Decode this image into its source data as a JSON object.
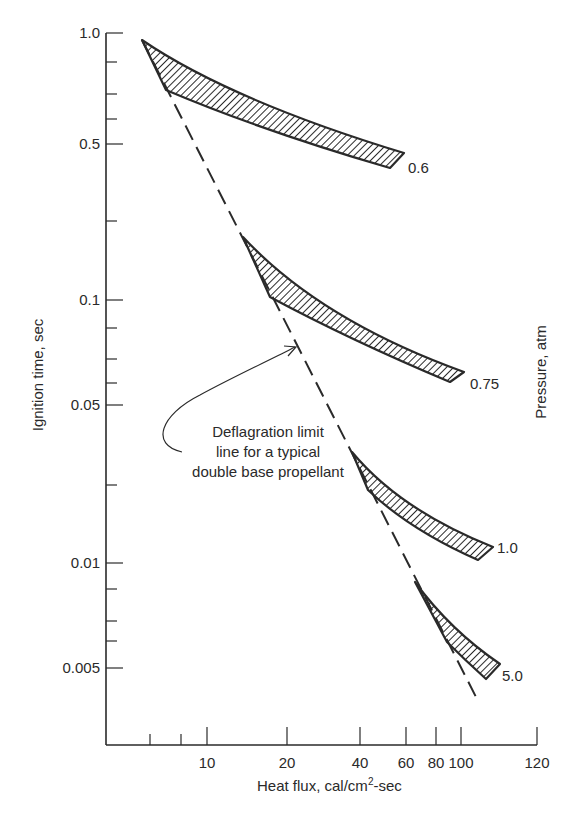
{
  "chart_data": {
    "type": "line",
    "title": "",
    "xlabel": "Heat flux, cal/cm²-sec",
    "xlabel_main": "Heat flux, cal/cm",
    "xlabel_sup": "2",
    "xlabel_tail": "-sec",
    "ylabel": "Ignition time, sec",
    "y2label": "Pressure, atm",
    "xscale": "log",
    "yscale": "log",
    "xlim": [
      5,
      120
    ],
    "ylim": [
      0.003,
      1.0
    ],
    "grid": false,
    "x_ticks": [
      {
        "label": "10",
        "px": 207
      },
      {
        "label": "20",
        "px": 287
      },
      {
        "label": "40",
        "px": 360
      },
      {
        "label": "60",
        "px": 406
      },
      {
        "label": "80",
        "px": 436
      },
      {
        "label": "100",
        "px": 461
      },
      {
        "label": "120",
        "px": 537
      }
    ],
    "x_minor_ticks_px": [
      150,
      181
    ],
    "y_ticks": [
      {
        "label": "1.0",
        "px": 33
      },
      {
        "label": "0.5",
        "px": 144
      },
      {
        "label": "0.1",
        "px": 300
      },
      {
        "label": "0.05",
        "px": 405
      },
      {
        "label": "0.01",
        "px": 563
      },
      {
        "label": "0.005",
        "px": 668
      }
    ],
    "y_minor_ticks_px": [
      62,
      94,
      119,
      221,
      328,
      359,
      383,
      485,
      589,
      621,
      641
    ],
    "series": [
      {
        "name": "0.6",
        "kind": "hatched band",
        "pressure_atm": 0.6,
        "x": [
          5.5,
          10,
          20,
          40,
          60
        ],
        "y_upper": [
          0.95,
          0.75,
          0.6,
          0.5,
          0.45
        ],
        "y_lower": [
          0.75,
          0.65,
          0.53,
          0.45,
          0.42
        ],
        "label_pos": [
          408,
          168
        ]
      },
      {
        "name": "0.75",
        "kind": "hatched band",
        "pressure_atm": 0.75,
        "x": [
          14,
          20,
          40,
          60,
          100
        ],
        "y_upper": [
          0.2,
          0.15,
          0.1,
          0.075,
          0.06
        ],
        "y_lower": [
          0.15,
          0.1,
          0.075,
          0.065,
          0.055
        ],
        "label_pos": [
          470,
          384
        ]
      },
      {
        "name": "1.0",
        "kind": "hatched band",
        "pressure_atm": 1.0,
        "x": [
          38,
          45,
          60,
          80,
          110
        ],
        "y_upper": [
          0.035,
          0.027,
          0.02,
          0.015,
          0.011
        ],
        "y_lower": [
          0.03,
          0.022,
          0.016,
          0.013,
          0.01
        ],
        "label_pos": [
          497,
          548
        ]
      },
      {
        "name": "5.0",
        "kind": "hatched band",
        "pressure_atm": 5.0,
        "x": [
          70,
          80,
          90,
          100,
          110
        ],
        "y_upper": [
          0.0085,
          0.007,
          0.006,
          0.0055,
          0.005
        ],
        "y_lower": [
          0.0075,
          0.006,
          0.0052,
          0.0048,
          0.0045
        ],
        "label_pos": [
          502,
          676
        ]
      },
      {
        "name": "Deflagration limit line",
        "kind": "dashed line",
        "x": [
          5.5,
          110
        ],
        "y": [
          0.95,
          0.0035
        ]
      }
    ],
    "annotations": [
      {
        "text": "Deflagration limit line for a typical double base propellant",
        "lines": [
          "Deflagration limit",
          "line for a typical",
          "double base propellant"
        ],
        "points_to": "Deflagration limit line"
      }
    ]
  },
  "geometry": {
    "axis": {
      "x0": 106,
      "y_top": 33,
      "y_bottom": 745,
      "x_right": 537
    },
    "dashed_line": {
      "x1": 142,
      "y1": 40,
      "x2": 476,
      "y2": 697
    },
    "bands": [
      {
        "name": "0.6",
        "path": "M142,40 Q230,100 404,153 L390,168 Q260,130 166,90 Z"
      },
      {
        "name": "0.75",
        "path": "M243,237 Q320,320 464,372 L450,382 Q350,340 270,297 Z"
      },
      {
        "name": "1.0",
        "path": "M352,452 Q400,510 493,547 L478,560 Q410,530 368,490 Z"
      },
      {
        "name": "5.0",
        "path": "M415,582 Q450,630 500,664 L486,679 Q465,660 447,642 Z"
      }
    ],
    "arrow": {
      "path": "M182,452 C150,445 160,415 200,395 C235,376 270,360 295,347",
      "head": "M284,346 L296,347 L288,356"
    }
  }
}
